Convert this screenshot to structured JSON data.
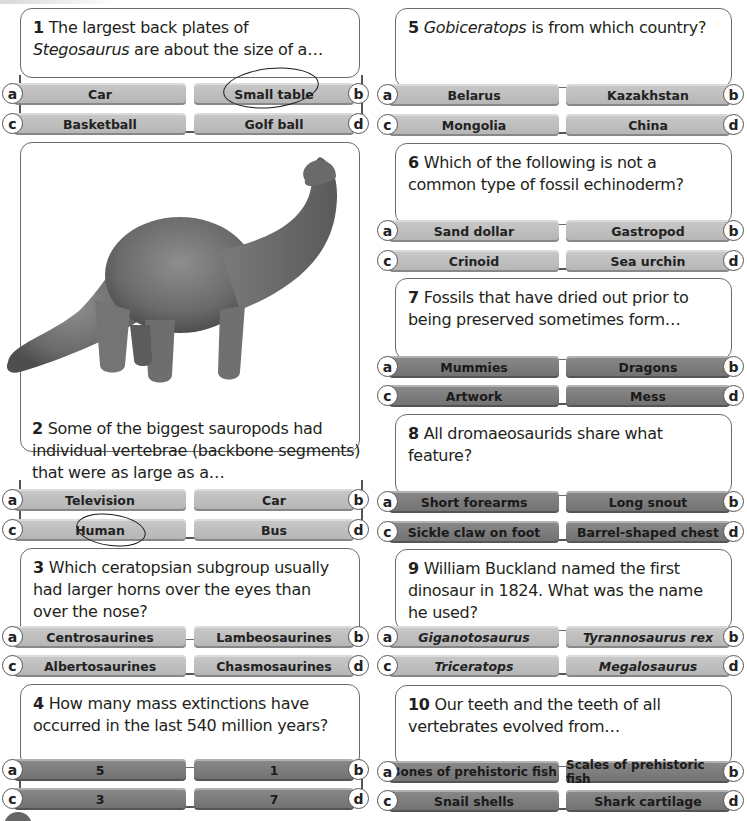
{
  "quiz": {
    "questions": [
      {
        "number": "1",
        "text_before": "The largest back plates of ",
        "text_italic": "Stegosaurus",
        "text_after": " are about the size of a…",
        "answers": {
          "a": "Car",
          "b": "Small table",
          "c": "Basketball",
          "d": "Golf ball"
        },
        "circled": "b",
        "style": "light"
      },
      {
        "number": "2",
        "text_before": "Some of the biggest sauropods had individual vertebrae (backbone segments) that were as large as a…",
        "text_italic": "",
        "text_after": "",
        "answers": {
          "a": "Television",
          "b": "Car",
          "c": "Human",
          "d": "Bus"
        },
        "circled": "c",
        "style": "light",
        "image": "sauropod-illustration"
      },
      {
        "number": "3",
        "text_before": "Which ceratopsian subgroup usually had larger horns over the eyes than over the nose?",
        "text_italic": "",
        "text_after": "",
        "answers": {
          "a": "Centrosaurines",
          "b": "Lambeosaurines",
          "c": "Albertosaurines",
          "d": "Chasmosaurines"
        },
        "style": "light"
      },
      {
        "number": "4",
        "text_before": "How many mass extinctions have occurred in the last 540 million years?",
        "text_italic": "",
        "text_after": "",
        "answers": {
          "a": "5",
          "b": "1",
          "c": "3",
          "d": "7"
        },
        "style": "dark"
      },
      {
        "number": "5",
        "text_before": "",
        "text_italic": "Gobiceratops",
        "text_after": " is from which country?",
        "answers": {
          "a": "Belarus",
          "b": "Kazakhstan",
          "c": "Mongolia",
          "d": "China"
        },
        "style": "light"
      },
      {
        "number": "6",
        "text_before": "Which of the following is not a common type of fossil echinoderm?",
        "text_italic": "",
        "text_after": "",
        "answers": {
          "a": "Sand dollar",
          "b": "Gastropod",
          "c": "Crinoid",
          "d": "Sea urchin"
        },
        "style": "light"
      },
      {
        "number": "7",
        "text_before": "Fossils that have dried out prior to being preserved sometimes form…",
        "text_italic": "",
        "text_after": "",
        "answers": {
          "a": "Mummies",
          "b": "Dragons",
          "c": "Artwork",
          "d": "Mess"
        },
        "style": "dark"
      },
      {
        "number": "8",
        "text_before": "All dromaeosaurids share what feature?",
        "text_italic": "",
        "text_after": "",
        "answers": {
          "a": "Short forearms",
          "b": "Long snout",
          "c": "Sickle claw on foot",
          "d": "Barrel-shaped chest"
        },
        "style": "dark"
      },
      {
        "number": "9",
        "text_before": "William Buckland named the first dinosaur in 1824. What was the name he used?",
        "text_italic": "",
        "text_after": "",
        "answers": {
          "a": "Giganotosaurus",
          "b": "Tyrannosaurus rex",
          "c": "Triceratops",
          "d": "Megalosaurus"
        },
        "answers_italic": true,
        "style": "light"
      },
      {
        "number": "10",
        "text_before": "Our teeth and the teeth of all vertebrates evolved from…",
        "text_italic": "",
        "text_after": "",
        "answers": {
          "a": "Bones of prehistoric fish",
          "b": "Scales of prehistoric fish",
          "c": "Snail shells",
          "d": "Shark cartilage"
        },
        "style": "dark"
      }
    ],
    "letters": {
      "a": "a",
      "b": "b",
      "c": "c",
      "d": "d"
    }
  },
  "colors": {
    "light_button": "#bdbdbd",
    "dark_button": "#7a7a7a",
    "border": "#6a6a6a"
  }
}
